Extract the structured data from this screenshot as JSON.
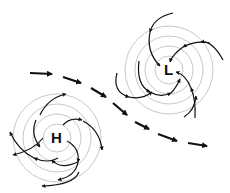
{
  "diagram": {
    "high": {
      "label": "H",
      "cx": 57,
      "cy": 138,
      "rings": [
        14,
        24,
        34,
        44
      ]
    },
    "low": {
      "label": "L",
      "cx": 169,
      "cy": 70,
      "rings": [
        14,
        24,
        34,
        44
      ]
    },
    "jet_stream_arrows": [
      [
        30,
        73,
        52,
        74
      ],
      [
        63,
        77,
        81,
        83
      ],
      [
        91,
        88,
        106,
        97
      ],
      [
        113,
        103,
        127,
        115
      ],
      [
        135,
        122,
        149,
        129
      ],
      [
        158,
        134,
        177,
        141
      ],
      [
        188,
        143,
        207,
        146
      ]
    ],
    "colors": {
      "ring": "#c8c8c8",
      "arrow": "#111111",
      "background": "#ffffff"
    }
  }
}
